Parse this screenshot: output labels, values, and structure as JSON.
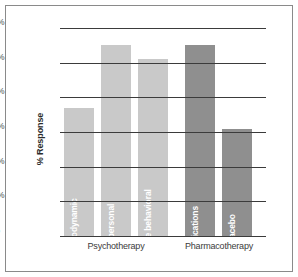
{
  "chart_data": {
    "type": "bar",
    "title": "",
    "xlabel": "",
    "ylabel": "% Response",
    "ylim": [
      0,
      60
    ],
    "grid": true,
    "legend": "none",
    "ytick_labels": [
      "60%",
      "50%",
      "40%",
      "30%",
      "20%",
      "10%",
      "0%"
    ],
    "ytick_values": [
      60,
      50,
      40,
      30,
      20,
      10,
      0
    ],
    "categories": [
      "Psychodynamic",
      "Interpersonal",
      "Cognitive behavioral",
      "Medications",
      "Placebo"
    ],
    "values": [
      37,
      55,
      51,
      55,
      31
    ],
    "groups": [
      {
        "label": "Psychotherapy",
        "categories": [
          "Psychodynamic",
          "Interpersonal",
          "Cognitive behavioral"
        ],
        "values": [
          37,
          55,
          51
        ],
        "color": "#c9c9c9"
      },
      {
        "label": "Pharmacotherapy",
        "categories": [
          "Medications",
          "Placebo"
        ],
        "values": [
          55,
          31
        ],
        "color": "#8f8f8f"
      }
    ]
  },
  "bars": [
    {
      "name": "Psychodynamic",
      "value": 37,
      "shade": "light",
      "left": 4,
      "width": 30
    },
    {
      "name": "Interpersonal",
      "value": 55,
      "shade": "light",
      "left": 41,
      "width": 30
    },
    {
      "name": "Cognitive behavioral",
      "value": 51,
      "shade": "light",
      "left": 78,
      "width": 30
    },
    {
      "name": "Medications",
      "value": 55,
      "shade": "dark",
      "left": 125,
      "width": 30
    },
    {
      "name": "Placebo",
      "value": 31,
      "shade": "dark",
      "left": 162,
      "width": 30
    }
  ],
  "axis": {
    "y_title": "% Response",
    "ticks": [
      "60%",
      "50%",
      "40%",
      "30%",
      "20%",
      "10%",
      "0%"
    ]
  },
  "group_labels": [
    {
      "text": "Psychotherapy",
      "center": 56
    },
    {
      "text": "Pharmacotherapy",
      "center": 159
    }
  ]
}
